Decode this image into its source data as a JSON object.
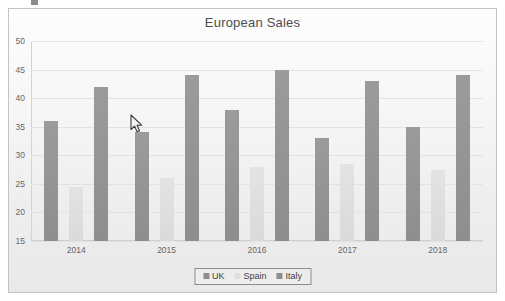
{
  "chart_data": {
    "type": "bar",
    "title": "European Sales",
    "xlabel": "",
    "ylabel": "",
    "categories": [
      "2014",
      "2015",
      "2016",
      "2017",
      "2018"
    ],
    "series": [
      {
        "name": "UK",
        "values": [
          36,
          34,
          38,
          33,
          35
        ],
        "color": "#8e8e8e"
      },
      {
        "name": "Spain",
        "values": [
          24.5,
          26,
          28,
          28.5,
          27.5
        ],
        "color": "#dedede"
      },
      {
        "name": "Italy",
        "values": [
          42,
          44,
          45,
          43,
          44
        ],
        "color": "#8e8e8e"
      }
    ],
    "ylim": [
      15,
      50
    ],
    "ytick_values": [
      50,
      45,
      40,
      35,
      30,
      25,
      20,
      15
    ],
    "ytick_labels": [
      "50",
      "45",
      "40",
      "35",
      "30",
      "25",
      "20",
      "15"
    ],
    "grid": true,
    "legend_position": "bottom-center"
  },
  "legend": {
    "items": [
      {
        "label": "UK"
      },
      {
        "label": "Spain"
      },
      {
        "label": "Italy"
      }
    ]
  },
  "cursor": {
    "icon": "arrow-pointer-cursor",
    "x": 130,
    "y": 114
  }
}
